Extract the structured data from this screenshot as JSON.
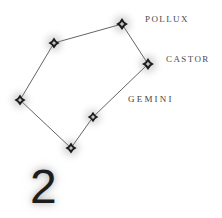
{
  "card": {
    "background_color": "#ffffff",
    "width": 222,
    "height": 218
  },
  "page_number": "2",
  "labels": {
    "pollux": "Pollux",
    "castor": "Castor",
    "gemini": "Gemini"
  },
  "chart_data": {
    "type": "scatter",
    "title": "Gemini",
    "subtitle": "",
    "xlabel": "",
    "ylabel": "",
    "xlim": [
      0,
      222
    ],
    "ylim": [
      0,
      218
    ],
    "grid": false,
    "legend": "none",
    "note": "Star chart of the constellation Gemini, drawn as labelled star nodes joined by asterism lines. Coordinates are in image pixel space, origin top-left.",
    "star_color": "#1a1a1a",
    "line_color": "#3a3a3a",
    "stars": [
      {
        "id": "pollux",
        "label": "Pollux",
        "x": 122,
        "y": 24,
        "size": 9.5,
        "magnitude_rank": 1
      },
      {
        "id": "castor",
        "label": "Castor",
        "x": 148,
        "y": 64,
        "size": 9.5,
        "magnitude_rank": 2
      },
      {
        "id": "upper_left",
        "label": "",
        "x": 54,
        "y": 43,
        "size": 9.0,
        "magnitude_rank": 3
      },
      {
        "id": "far_left",
        "label": "",
        "x": 20,
        "y": 100,
        "size": 9.0,
        "magnitude_rank": 4
      },
      {
        "id": "middle",
        "label": "",
        "x": 93,
        "y": 117,
        "size": 8.5,
        "magnitude_rank": 5
      },
      {
        "id": "bottom",
        "label": "",
        "x": 71,
        "y": 148,
        "size": 9.0,
        "magnitude_rank": 6
      }
    ],
    "lines": [
      {
        "from": "upper_left",
        "to": "pollux"
      },
      {
        "from": "pollux",
        "to": "castor"
      },
      {
        "from": "upper_left",
        "to": "far_left"
      },
      {
        "from": "castor",
        "to": "middle"
      },
      {
        "from": "far_left",
        "to": "bottom"
      },
      {
        "from": "bottom",
        "to": "middle"
      }
    ],
    "label_positions": [
      {
        "id": "pollux",
        "text": "Pollux",
        "x": 145,
        "y": 12
      },
      {
        "id": "castor",
        "text": "Castor",
        "x": 166,
        "y": 52
      },
      {
        "id": "gemini",
        "text": "Gemini",
        "x": 128,
        "y": 91
      }
    ]
  }
}
